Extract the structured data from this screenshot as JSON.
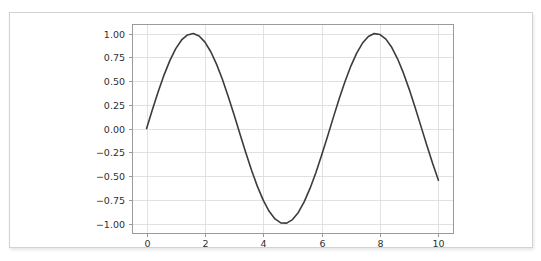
{
  "chart_data": {
    "type": "line",
    "title": "",
    "xlabel": "",
    "ylabel": "",
    "xlim": [
      -0.5,
      10.5
    ],
    "ylim": [
      -1.1,
      1.1
    ],
    "grid": true,
    "legend": null,
    "line_color": "#3c3c3c",
    "grid_color": "#d9d9d9",
    "axis_color": "#9a9a9a",
    "background_color": "#ffffff",
    "xticks": [
      0,
      2,
      4,
      6,
      8,
      10
    ],
    "xtick_labels": [
      "0",
      "2",
      "4",
      "6",
      "8",
      "10"
    ],
    "yticks": [
      -1.0,
      -0.75,
      -0.5,
      -0.25,
      0.0,
      0.25,
      0.5,
      0.75,
      1.0
    ],
    "ytick_labels": [
      "−1.00",
      "−0.75",
      "−0.50",
      "−0.25",
      "0.00",
      "0.25",
      "0.50",
      "0.75",
      "1.00"
    ],
    "series": [
      {
        "name": "sin(x)",
        "x": [
          0.0,
          0.2,
          0.4,
          0.6,
          0.8,
          1.0,
          1.2,
          1.4,
          1.6,
          1.8,
          2.0,
          2.2,
          2.4,
          2.6,
          2.8,
          3.0,
          3.2,
          3.4,
          3.6,
          3.8,
          4.0,
          4.2,
          4.4,
          4.6,
          4.8,
          5.0,
          5.2,
          5.4,
          5.6,
          5.8,
          6.0,
          6.2,
          6.4,
          6.6,
          6.8,
          7.0,
          7.2,
          7.4,
          7.6,
          7.8,
          8.0,
          8.2,
          8.4,
          8.6,
          8.8,
          9.0,
          9.2,
          9.4,
          9.6,
          9.8,
          10.0
        ],
        "y": [
          0.0,
          0.199,
          0.389,
          0.565,
          0.717,
          0.841,
          0.932,
          0.985,
          1.0,
          0.974,
          0.909,
          0.808,
          0.675,
          0.516,
          0.335,
          0.141,
          -0.058,
          -0.256,
          -0.443,
          -0.612,
          -0.757,
          -0.872,
          -0.952,
          -0.994,
          -0.996,
          -0.959,
          -0.883,
          -0.773,
          -0.631,
          -0.465,
          -0.279,
          -0.083,
          0.117,
          0.312,
          0.495,
          0.657,
          0.794,
          0.899,
          0.969,
          0.999,
          0.989,
          0.941,
          0.855,
          0.734,
          0.585,
          0.412,
          0.223,
          0.025,
          -0.174,
          -0.366,
          -0.544
        ]
      }
    ]
  }
}
